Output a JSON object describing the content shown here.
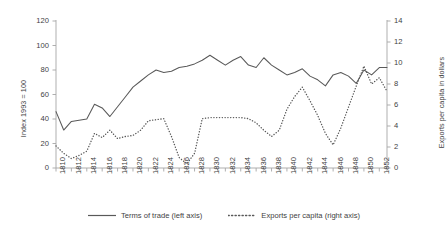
{
  "chart_data": {
    "type": "line",
    "title": "",
    "xlabel": "",
    "x": [
      1810,
      1811,
      1812,
      1813,
      1814,
      1815,
      1816,
      1817,
      1818,
      1819,
      1820,
      1821,
      1822,
      1823,
      1824,
      1825,
      1826,
      1827,
      1828,
      1829,
      1830,
      1831,
      1832,
      1833,
      1834,
      1835,
      1836,
      1837,
      1838,
      1839,
      1840,
      1841,
      1842,
      1843,
      1844,
      1845,
      1846,
      1847,
      1848,
      1849,
      1850,
      1851,
      1852,
      1853
    ],
    "xlim": [
      1810,
      1853
    ],
    "xtick_labels": [
      "1810",
      "1812",
      "1814",
      "1816",
      "1818",
      "1820",
      "1822",
      "1824",
      "1826",
      "1828",
      "1830",
      "1832",
      "1834",
      "1836",
      "1838",
      "1840",
      "1842",
      "1844",
      "1846",
      "1848",
      "1850",
      "1852"
    ],
    "grid": false,
    "legend_position": "bottom",
    "axes": [
      {
        "id": "left",
        "label": "Index 1993 = 100",
        "lim": [
          0,
          120
        ],
        "ticks": [
          0,
          20,
          40,
          60,
          80,
          100,
          120
        ],
        "tick_labels": [
          "0",
          "20",
          "40",
          "60",
          "80",
          "100",
          "120"
        ]
      },
      {
        "id": "right",
        "label": "Exports per capita in dollars",
        "lim": [
          0,
          14
        ],
        "ticks": [
          0,
          2,
          4,
          6,
          8,
          10,
          12,
          14
        ],
        "tick_labels": [
          "0",
          "2",
          "4",
          "6",
          "8",
          "10",
          "12",
          "14"
        ]
      }
    ],
    "series": [
      {
        "name": "Terms of trade (left axis)",
        "legend_label": "Terms of trade (left axis)",
        "axis": "left",
        "style": "solid",
        "color": "#595959",
        "values": [
          46,
          31,
          38,
          39,
          40,
          52,
          49,
          42,
          50,
          58,
          66,
          71,
          76,
          80,
          78,
          79,
          82,
          83,
          85,
          88,
          92,
          88,
          84,
          88,
          91,
          84,
          82,
          90,
          84,
          80,
          76,
          78,
          81,
          75,
          72,
          67,
          76,
          78,
          75,
          69,
          80,
          76,
          82,
          82
        ]
      },
      {
        "name": "Exports per capita (right axis)",
        "legend_label": "Exports per capita (right axis)",
        "axis": "right",
        "style": "dotted",
        "color": "#595959",
        "values": [
          2.1,
          1.4,
          0.9,
          1.2,
          1.6,
          3.3,
          2.9,
          3.6,
          2.8,
          3.0,
          3.1,
          3.6,
          4.5,
          4.6,
          4.7,
          3.0,
          1.0,
          0.4,
          1.4,
          4.7,
          4.8,
          4.8,
          4.8,
          4.8,
          4.8,
          4.7,
          4.3,
          3.6,
          3.0,
          3.6,
          5.6,
          6.8,
          7.7,
          6.4,
          5.0,
          3.3,
          2.2,
          3.8,
          5.8,
          7.8,
          9.7,
          8.0,
          8.6,
          7.3
        ]
      }
    ]
  }
}
